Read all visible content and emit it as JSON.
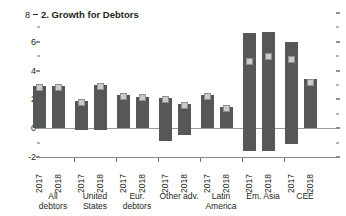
{
  "panel": {
    "axis_max_label": "8",
    "title": "2. Growth for Debtors"
  },
  "chart_data": {
    "type": "bar",
    "title": "2. Growth for Debtors",
    "xlabel": "",
    "ylabel": "",
    "ylim": [
      -2,
      8
    ],
    "yticks": [
      8,
      6,
      4,
      2,
      0,
      -2
    ],
    "ytick_labels": [
      "8",
      "6",
      "4",
      "2",
      "0",
      "-2"
    ],
    "minor_ticks": [
      7,
      5,
      3,
      1,
      -1
    ],
    "grid": false,
    "legend": null,
    "categories": [
      "All debtors",
      "United States",
      "Eur. debtors",
      "Other adv.",
      "Latin America",
      "Em. Asia",
      "CEE"
    ],
    "subcategories": [
      "2017",
      "2018"
    ],
    "series": [
      {
        "name": "Bar value",
        "values": [
          [
            2.9,
            2.9
          ],
          [
            1.9,
            3.0
          ],
          [
            2.3,
            2.2
          ],
          [
            2.1,
            1.7
          ],
          [
            2.3,
            1.5
          ],
          [
            6.6,
            6.7
          ],
          [
            6.0,
            3.4
          ]
        ]
      },
      {
        "name": "Marker",
        "values": [
          [
            2.8,
            2.8
          ],
          [
            1.8,
            2.9
          ],
          [
            2.2,
            2.1
          ],
          [
            2.0,
            1.6
          ],
          [
            2.2,
            1.4
          ],
          [
            4.6,
            5.0
          ],
          [
            4.8,
            3.2
          ]
        ]
      }
    ]
  },
  "groups": [
    {
      "label": "All\ndebtors",
      "center": 53,
      "bars": [
        {
          "year": "2017",
          "x": 33,
          "w": 13,
          "top_value": 2.9,
          "marker_value": 2.8,
          "bottom_value": 0
        },
        {
          "year": "2018",
          "x": 52,
          "w": 13,
          "top_value": 2.9,
          "marker_value": 2.8,
          "bottom_value": 0
        }
      ]
    },
    {
      "label": "United\nStates",
      "center": 95,
      "bars": [
        {
          "year": "2017",
          "x": 75,
          "w": 13,
          "top_value": 1.9,
          "marker_value": 1.8,
          "bottom_value": -0.15
        },
        {
          "year": "2018",
          "x": 94,
          "w": 13,
          "top_value": 3.0,
          "marker_value": 2.9,
          "bottom_value": -0.15
        }
      ]
    },
    {
      "label": "Eur.\ndebtors",
      "center": 137,
      "bars": [
        {
          "year": "2017",
          "x": 117,
          "w": 13,
          "top_value": 2.3,
          "marker_value": 2.2,
          "bottom_value": 0
        },
        {
          "year": "2018",
          "x": 136,
          "w": 13,
          "top_value": 2.2,
          "marker_value": 2.1,
          "bottom_value": 0
        }
      ]
    },
    {
      "label": "Other adv.",
      "center": 179,
      "bars": [
        {
          "year": "2017",
          "x": 159,
          "w": 13,
          "top_value": 2.1,
          "marker_value": 2.0,
          "bottom_value": -0.9
        },
        {
          "year": "2018",
          "x": 178,
          "w": 13,
          "top_value": 1.7,
          "marker_value": 1.6,
          "bottom_value": -0.5
        }
      ]
    },
    {
      "label": "Latin\nAmerica",
      "center": 221,
      "bars": [
        {
          "year": "2017",
          "x": 201,
          "w": 13,
          "top_value": 2.3,
          "marker_value": 2.2,
          "bottom_value": 0
        },
        {
          "year": "2018",
          "x": 220,
          "w": 13,
          "top_value": 1.5,
          "marker_value": 1.4,
          "bottom_value": 0
        }
      ]
    },
    {
      "label": "Em. Asia",
      "center": 263,
      "bars": [
        {
          "year": "2017",
          "x": 243,
          "w": 13,
          "top_value": 6.6,
          "marker_value": 4.6,
          "bottom_value": -1.6
        },
        {
          "year": "2018",
          "x": 262,
          "w": 13,
          "top_value": 6.7,
          "marker_value": 5.0,
          "bottom_value": -1.6
        }
      ]
    },
    {
      "label": "CEE",
      "center": 305,
      "bars": [
        {
          "year": "2017",
          "x": 285,
          "w": 13,
          "top_value": 6.0,
          "marker_value": 4.8,
          "bottom_value": -1.1
        },
        {
          "year": "2018",
          "x": 304,
          "w": 13,
          "top_value": 3.4,
          "marker_value": 3.2,
          "bottom_value": 0
        }
      ]
    }
  ],
  "colors": {
    "bar": "#555759",
    "marker": "#c9cacb",
    "axis": "#231f20",
    "zeroline": "#9a9a9a"
  }
}
